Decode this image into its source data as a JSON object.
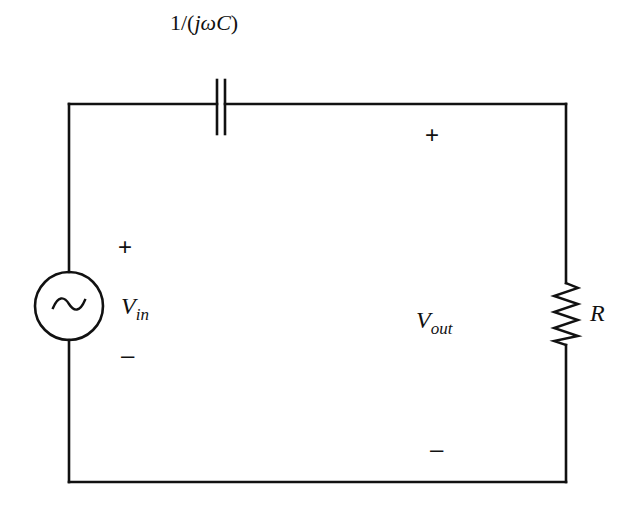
{
  "diagram": {
    "type": "circuit-schematic",
    "components": {
      "capacitor": {
        "label_prefix": "1/(",
        "label_j": "j",
        "label_omega": "ω",
        "label_C": "C",
        "label_suffix": ")",
        "impedance": "1/(jωC)"
      },
      "source": {
        "symbol": "~",
        "type": "AC voltage source",
        "var_main": "V",
        "var_sub": "in",
        "plus": "+",
        "minus": "–"
      },
      "resistor": {
        "label": "R"
      },
      "output": {
        "var_main": "V",
        "var_sub": "out",
        "plus": "+",
        "minus": "–"
      }
    },
    "colors": {
      "stroke": "#111111",
      "background": "#ffffff"
    }
  }
}
